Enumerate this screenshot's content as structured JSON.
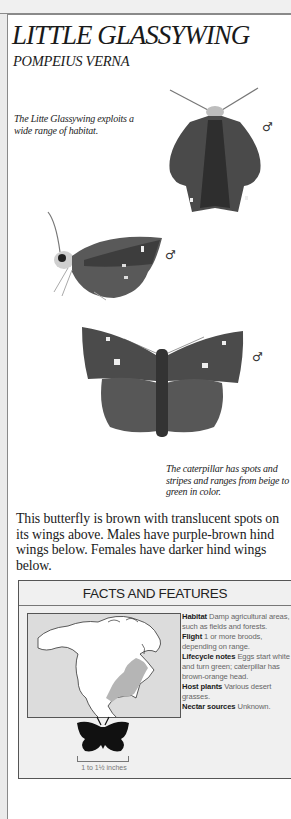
{
  "header": {
    "title": "LITTLE GLASSYWING",
    "scientific_name": "POMPEIUS VERNA"
  },
  "captions": {
    "habitat": "The Litte Glassywing exploits a wide range of habitat.",
    "caterpillar": "The caterpillar has spots and stripes and ranges from beige to green in color."
  },
  "illustrations": [
    {
      "view": "upperside-top",
      "sex_symbol": "♂"
    },
    {
      "view": "side",
      "sex_symbol": "♂"
    },
    {
      "view": "upperside-spread",
      "sex_symbol": "♂"
    }
  ],
  "description": "This butterfly is brown with translucent spots on its wings above. Males have purple-brown hind wings below. Females have darker hind wings below.",
  "facts": {
    "heading": "FACTS AND FEATURES",
    "items": [
      {
        "label": "Habitat",
        "value": "Damp agricultural areas, such as fields and forests."
      },
      {
        "label": "Flight",
        "value": "1 or more broods, depending on range."
      },
      {
        "label": "Lifecycle notes",
        "value": "Eggs start white and turn green; caterpillar has brown-orange head."
      },
      {
        "label": "Host plants",
        "value": "Various desert grasses."
      },
      {
        "label": "Nectar sources",
        "value": "Unknown."
      }
    ],
    "map_label": "range-map-north-america",
    "size": "1 to 1½ inches"
  }
}
